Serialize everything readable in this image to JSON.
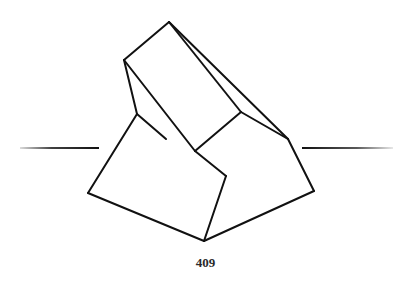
{
  "page": {
    "number": "409"
  },
  "figure": {
    "stroke_color": "#111111",
    "rule_left": {
      "x1": 20,
      "y1": 148,
      "x2": 99,
      "y2": 148
    },
    "rule_right": {
      "x1": 302,
      "y1": 148,
      "x2": 393,
      "y2": 148
    },
    "edges": [
      [
        124,
        60,
        169,
        22
      ],
      [
        169,
        22,
        241,
        112
      ],
      [
        169,
        22,
        288,
        139
      ],
      [
        241,
        112,
        288,
        139
      ],
      [
        124,
        60,
        195,
        151
      ],
      [
        195,
        151,
        241,
        112
      ],
      [
        124,
        60,
        137,
        114
      ],
      [
        137,
        114,
        166,
        139
      ],
      [
        137,
        114,
        88,
        193
      ],
      [
        88,
        193,
        204,
        241
      ],
      [
        195,
        151,
        226,
        176
      ],
      [
        226,
        176,
        204,
        241
      ],
      [
        204,
        241,
        314,
        191
      ],
      [
        314,
        191,
        288,
        139
      ]
    ]
  }
}
